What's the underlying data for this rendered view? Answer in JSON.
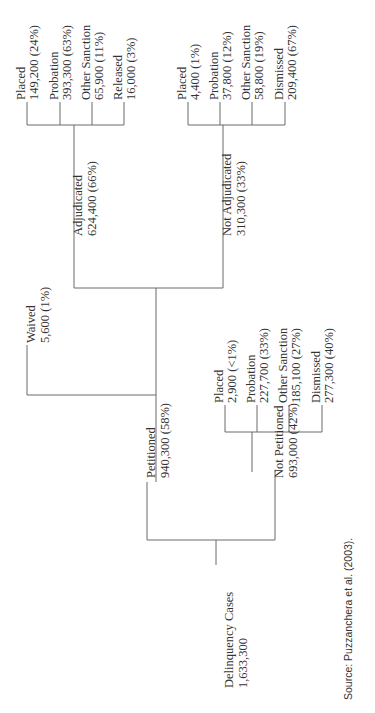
{
  "figure": {
    "orientation": "rotated-90-ccw",
    "line_color": "#6a6a6a",
    "text_color": "#333333",
    "source": "Source:  Puzzanchera et al. (2003)."
  },
  "tree": {
    "root": {
      "label": "Delinquency Cases",
      "value": "1,633,300"
    },
    "petitioned": {
      "label": "Petitioned",
      "value": "940,300 (58%)"
    },
    "not_petitioned": {
      "label": "Not Petitioned",
      "value": "693,000 (42%)"
    },
    "waived": {
      "label": "Waived",
      "value": "5,600 (1%)"
    },
    "adjudicated": {
      "label": "Adjudicated",
      "value": "624,400 (66%)"
    },
    "not_adjudicated": {
      "label": "Not Adjudicated",
      "value": "310,300 (33%)"
    },
    "adjudicated_children": [
      {
        "label": "Placed",
        "value": "149,200 (24%)"
      },
      {
        "label": "Probation",
        "value": "393,300 (63%)"
      },
      {
        "label": "Other Sanction",
        "value": "65,900 (11%)"
      },
      {
        "label": "Released",
        "value": "16,000 (3%)"
      }
    ],
    "not_adjudicated_children": [
      {
        "label": "Placed",
        "value": "4,400 (1%)"
      },
      {
        "label": "Probation",
        "value": "37,800 (12%)"
      },
      {
        "label": "Other Sanction",
        "value": "58,800 (19%)"
      },
      {
        "label": "Dismissed",
        "value": "209,400 (67%)"
      }
    ],
    "not_petitioned_children": [
      {
        "label": "Placed",
        "value": "2,900 (<1%)"
      },
      {
        "label": "Probation",
        "value": "227,700 (33%)"
      },
      {
        "label": "Other Sanction",
        "value": "185,100 (27%)"
      },
      {
        "label": "Dismissed",
        "value": "277,300 (40%)"
      }
    ]
  }
}
